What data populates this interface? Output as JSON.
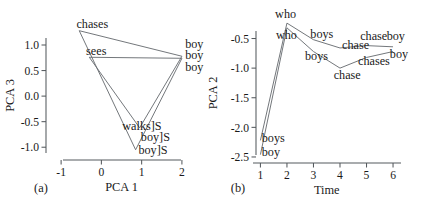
{
  "figure": {
    "panel_a_label": "(a)",
    "panel_b_label": "(b)"
  },
  "chart_data": [
    {
      "type": "line",
      "panel": "(a)",
      "title": "",
      "xlabel": "PCA 1",
      "ylabel": "PCA 3",
      "xlim": [
        -1.45,
        2.35
      ],
      "ylim": [
        -1.25,
        1.45
      ],
      "xticks": [
        -1,
        0,
        1,
        2
      ],
      "xticklabels": [
        "-1",
        "0",
        "1",
        "2"
      ],
      "yticks": [
        1.0,
        0.5,
        0.0,
        -0.5,
        -1.0
      ],
      "yticklabels": [
        "1.0",
        "0.5",
        "0.0",
        "-0.5",
        "-1.0"
      ],
      "grid": false,
      "legend": "none",
      "series": [
        {
          "name": "chases-trajectory",
          "x": [
            -0.55,
            2.0,
            0.95
          ],
          "y": [
            1.28,
            0.78,
            -0.62
          ]
        },
        {
          "name": "chases-to-boyS",
          "x": [
            -0.55,
            0.85
          ],
          "y": [
            1.28,
            -1.05
          ]
        },
        {
          "name": "sees-trajectory",
          "x": [
            -0.3,
            2.0,
            0.85
          ],
          "y": [
            0.76,
            0.74,
            -1.05
          ]
        },
        {
          "name": "sees-down",
          "x": [
            -0.3,
            0.95
          ],
          "y": [
            0.76,
            -0.62
          ]
        }
      ],
      "annotations": [
        {
          "text": "chases",
          "x": -0.62,
          "y": 1.42,
          "anchor": "start"
        },
        {
          "text": "sees",
          "x": -0.38,
          "y": 0.88,
          "anchor": "start"
        },
        {
          "text": "boy",
          "x": 2.08,
          "y": 1.02,
          "anchor": "start"
        },
        {
          "text": "boy",
          "x": 2.08,
          "y": 0.8,
          "anchor": "start"
        },
        {
          "text": "boy",
          "x": 2.08,
          "y": 0.58,
          "anchor": "start"
        },
        {
          "text": "walks]S",
          "x": 0.52,
          "y": -0.58,
          "anchor": "start"
        },
        {
          "text": "boy]S",
          "x": 0.98,
          "y": -0.8,
          "anchor": "start"
        },
        {
          "text": "boy]S",
          "x": 0.92,
          "y": -1.05,
          "anchor": "start"
        }
      ]
    },
    {
      "type": "line",
      "panel": "(b)",
      "title": "",
      "xlabel": "Time",
      "ylabel": "PCA 2",
      "xlim": [
        0.72,
        6.3
      ],
      "ylim": [
        -2.72,
        -0.12
      ],
      "xticks": [
        1,
        2,
        3,
        4,
        5,
        6
      ],
      "xticklabels": [
        "1",
        "2",
        "3",
        "4",
        "5",
        "6"
      ],
      "yticks": [
        -0.5,
        -1.0,
        -1.5,
        -2.0,
        -2.5
      ],
      "yticklabels": [
        "-0.5",
        "-1.0",
        "-1.5",
        "-2.0",
        "-2.5"
      ],
      "grid": false,
      "legend": "none",
      "series": [
        {
          "name": "upper-trajectory",
          "x": [
            1,
            2,
            3,
            4,
            5,
            6
          ],
          "y": [
            -2.22,
            -0.24,
            -0.52,
            -0.66,
            -0.62,
            -0.64
          ]
        },
        {
          "name": "lower-trajectory",
          "x": [
            1,
            2,
            3,
            4,
            5,
            6
          ],
          "y": [
            -2.46,
            -0.32,
            -0.72,
            -1.0,
            -0.82,
            -0.72
          ]
        }
      ],
      "annotations": [
        {
          "text": "who",
          "x": 1.95,
          "y": -0.08,
          "anchor": "middle"
        },
        {
          "text": "who",
          "x": 1.98,
          "y": -0.44,
          "anchor": "middle"
        },
        {
          "text": "boys",
          "x": 2.88,
          "y": -0.42,
          "anchor": "start"
        },
        {
          "text": "boys",
          "x": 2.68,
          "y": -0.8,
          "anchor": "start"
        },
        {
          "text": "chase",
          "x": 4.08,
          "y": -0.6,
          "anchor": "start"
        },
        {
          "text": "chase",
          "x": 4.76,
          "y": -0.46,
          "anchor": "start"
        },
        {
          "text": "boy",
          "x": 5.76,
          "y": -0.46,
          "anchor": "start"
        },
        {
          "text": "boy",
          "x": 5.88,
          "y": -0.76,
          "anchor": "start"
        },
        {
          "text": "chases",
          "x": 4.68,
          "y": -0.88,
          "anchor": "start"
        },
        {
          "text": "chase",
          "x": 3.76,
          "y": -1.12,
          "anchor": "start"
        },
        {
          "text": "boys",
          "x": 1.05,
          "y": -2.18,
          "anchor": "start"
        },
        {
          "text": "boy",
          "x": 1.05,
          "y": -2.42,
          "anchor": "start"
        }
      ]
    }
  ]
}
